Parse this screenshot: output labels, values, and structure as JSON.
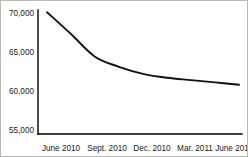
{
  "chart_data": {
    "type": "line",
    "title": "",
    "subtitle": "",
    "xlabel": "",
    "ylabel": "",
    "grid": false,
    "legend": false,
    "legend_position": "none",
    "line_color": "#111111",
    "categories": [
      "June 2010",
      "Sept. 2010",
      "Dec. 2010",
      "Mar. 2011",
      "June 2011"
    ],
    "series": [
      {
        "name": "",
        "values": [
          70100,
          64400,
          62200,
          61400,
          60800
        ]
      }
    ],
    "dense_points": {
      "x": [
        0.0,
        0.125,
        0.25,
        0.375,
        0.5,
        0.625,
        0.75,
        0.875,
        1.0
      ],
      "values": [
        70100,
        67300,
        64400,
        63100,
        62200,
        61700,
        61400,
        61100,
        60800
      ]
    },
    "ylim": [
      55000,
      70000
    ],
    "yticks": [
      70000,
      65000,
      60000,
      55000
    ],
    "ytick_labels": [
      "70,000",
      "65,000",
      "60,000",
      "55,000"
    ],
    "xtick_labels": [
      "June 2010",
      "Sept. 2010",
      "Dec. 2010",
      "Mar. 2011",
      "June 2011"
    ]
  },
  "axes": {
    "y_axis_name": "y-axis",
    "x_axis_name": "x-axis"
  }
}
